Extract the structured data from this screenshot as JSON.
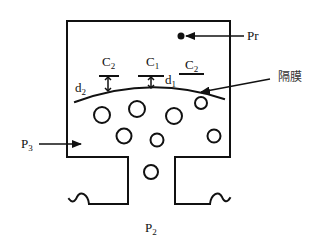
{
  "diagram": {
    "type": "capacitive-pressure-sensor-schematic",
    "labels": {
      "pr": "Pr",
      "c2_left": {
        "base": "C",
        "sub": "2"
      },
      "c1": {
        "base": "C",
        "sub": "1"
      },
      "c2_right": {
        "base": "C",
        "sub": "2"
      },
      "d1": {
        "base": "d",
        "sub": "1"
      },
      "d2": {
        "base": "d",
        "sub": "2"
      },
      "p3": {
        "base": "P",
        "sub": "3"
      },
      "p2": {
        "base": "P",
        "sub": "2"
      },
      "membrane": "隔膜"
    },
    "colors": {
      "stroke": "#111111",
      "background": "#ffffff"
    },
    "bubbles": [
      {
        "cx": 102,
        "cy": 115,
        "r": 8
      },
      {
        "cx": 137,
        "cy": 109,
        "r": 8
      },
      {
        "cx": 174,
        "cy": 116,
        "r": 8
      },
      {
        "cx": 201,
        "cy": 103,
        "r": 6
      },
      {
        "cx": 124,
        "cy": 136,
        "r": 7.5
      },
      {
        "cx": 157,
        "cy": 140,
        "r": 6.5
      },
      {
        "cx": 214,
        "cy": 136,
        "r": 6.5
      },
      {
        "cx": 151,
        "cy": 172,
        "r": 7
      }
    ]
  }
}
